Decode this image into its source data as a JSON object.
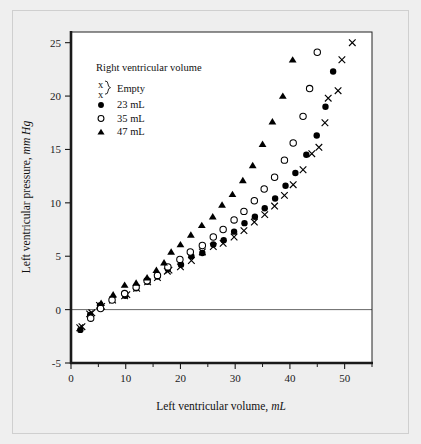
{
  "figure": {
    "background_color": "#eeeeee",
    "plot_background_color": "#ffffff"
  },
  "chart_data": {
    "type": "scatter",
    "title": "",
    "xlabel": "Left ventricular volume, mL",
    "xlabel_plain": "Left ventricular volume,",
    "xlabel_italic": "mL",
    "ylabel": "Left ventricular pressure, mm Hg",
    "ylabel_plain": "Left ventricular pressure,",
    "ylabel_italic": "mm Hg",
    "xlim": [
      0,
      55
    ],
    "ylim": [
      -5,
      26
    ],
    "xticks": [
      0,
      10,
      20,
      30,
      40,
      50
    ],
    "xticks_minor": [
      5,
      15,
      25,
      35,
      45,
      55
    ],
    "yticks": [
      -5,
      0,
      5,
      10,
      15,
      20,
      25
    ],
    "grid": false,
    "zero_line": true,
    "legend_position": "upper-left-inside",
    "legend_title": "Right ventricular volume",
    "series": [
      {
        "name": "Empty",
        "label": "Empty",
        "marker": "x",
        "color": "#000000",
        "points": [
          [
            1.6,
            -1.7
          ],
          [
            2.0,
            -1.6
          ],
          [
            3.4,
            -0.4
          ],
          [
            3.8,
            -0.3
          ],
          [
            5.2,
            0.4
          ],
          [
            5.6,
            0.3
          ],
          [
            7.6,
            0.9
          ],
          [
            9.8,
            1.3
          ],
          [
            10.2,
            1.4
          ],
          [
            12.0,
            2.0
          ],
          [
            14.0,
            2.6
          ],
          [
            15.8,
            3.0
          ],
          [
            17.6,
            3.6
          ],
          [
            17.9,
            3.7
          ],
          [
            20.0,
            4.0
          ],
          [
            22.0,
            4.6
          ],
          [
            24.0,
            5.4
          ],
          [
            26.0,
            5.9
          ],
          [
            27.8,
            6.2
          ],
          [
            29.8,
            6.8
          ],
          [
            31.6,
            7.4
          ],
          [
            33.5,
            8.2
          ],
          [
            35.4,
            8.9
          ],
          [
            37.2,
            9.7
          ],
          [
            39.0,
            10.7
          ],
          [
            40.6,
            11.7
          ],
          [
            42.4,
            13.1
          ],
          [
            44.0,
            14.6
          ],
          [
            45.3,
            15.2
          ],
          [
            46.4,
            17.5
          ],
          [
            47.0,
            19.8
          ],
          [
            48.8,
            20.5
          ],
          [
            49.5,
            23.4
          ],
          [
            51.4,
            25.0
          ]
        ]
      },
      {
        "name": "23 mL",
        "label": "23 mL",
        "marker": "filled-circle",
        "color": "#000000",
        "points": [
          [
            1.7,
            -1.9
          ],
          [
            3.5,
            -0.5
          ],
          [
            5.3,
            0.4
          ],
          [
            9.9,
            1.3
          ],
          [
            11.9,
            2.0
          ],
          [
            14.0,
            2.6
          ],
          [
            15.8,
            3.1
          ],
          [
            17.7,
            3.8
          ],
          [
            20.1,
            4.2
          ],
          [
            22.0,
            5.0
          ],
          [
            24.0,
            5.3
          ],
          [
            26.0,
            6.1
          ],
          [
            27.9,
            6.5
          ],
          [
            29.8,
            7.3
          ],
          [
            31.7,
            8.1
          ],
          [
            33.6,
            8.7
          ],
          [
            35.4,
            9.5
          ],
          [
            37.3,
            10.4
          ],
          [
            39.2,
            11.6
          ],
          [
            41.0,
            12.8
          ],
          [
            43.0,
            14.5
          ],
          [
            44.9,
            16.3
          ],
          [
            46.5,
            19.0
          ],
          [
            47.9,
            22.3
          ]
        ]
      },
      {
        "name": "35 mL",
        "label": "35 mL",
        "marker": "open-circle",
        "color": "#000000",
        "points": [
          [
            3.6,
            -0.8
          ],
          [
            5.4,
            0.1
          ],
          [
            7.5,
            0.9
          ],
          [
            9.8,
            1.5
          ],
          [
            11.9,
            2.1
          ],
          [
            13.9,
            2.7
          ],
          [
            15.8,
            3.2
          ],
          [
            17.7,
            4.0
          ],
          [
            19.9,
            4.7
          ],
          [
            21.8,
            5.4
          ],
          [
            24.0,
            6.0
          ],
          [
            26.0,
            6.8
          ],
          [
            27.8,
            7.5
          ],
          [
            29.8,
            8.4
          ],
          [
            31.6,
            9.2
          ],
          [
            33.5,
            10.2
          ],
          [
            35.3,
            11.3
          ],
          [
            37.2,
            12.4
          ],
          [
            39.0,
            14.0
          ],
          [
            40.6,
            15.6
          ],
          [
            42.4,
            18.1
          ],
          [
            43.6,
            20.7
          ],
          [
            45.0,
            24.1
          ]
        ]
      },
      {
        "name": "47 mL",
        "label": "47 mL",
        "marker": "filled-triangle",
        "color": "#000000",
        "points": [
          [
            5.5,
            0.6
          ],
          [
            7.7,
            1.4
          ],
          [
            9.8,
            2.3
          ],
          [
            11.9,
            2.5
          ],
          [
            13.9,
            3.0
          ],
          [
            15.6,
            3.7
          ],
          [
            17.0,
            4.4
          ],
          [
            18.3,
            5.4
          ],
          [
            20.0,
            6.1
          ],
          [
            21.9,
            7.0
          ],
          [
            23.9,
            7.9
          ],
          [
            25.9,
            8.7
          ],
          [
            27.6,
            9.8
          ],
          [
            29.5,
            10.8
          ],
          [
            31.4,
            12.1
          ],
          [
            33.2,
            13.5
          ],
          [
            35.0,
            15.5
          ],
          [
            36.8,
            17.6
          ],
          [
            38.7,
            20.0
          ],
          [
            40.5,
            23.4
          ]
        ]
      }
    ]
  },
  "legend": {
    "title": "Right ventricular volume",
    "entries": [
      {
        "marker": "x-pair-brace",
        "label": "Empty"
      },
      {
        "marker": "filled-circle",
        "label": "23 mL"
      },
      {
        "marker": "open-circle",
        "label": "35 mL"
      },
      {
        "marker": "filled-triangle",
        "label": "47 mL"
      }
    ]
  }
}
